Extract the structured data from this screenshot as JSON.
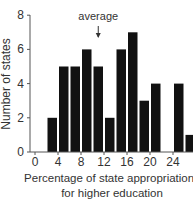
{
  "chart_data": {
    "type": "bar",
    "title": "",
    "xlabel": "Percentage of state appropriations for higher education",
    "xlabel_lines": [
      "Percentage of state appropriations",
      "for higher education"
    ],
    "ylabel": "Number of states",
    "bins": [
      [
        2,
        4
      ],
      [
        4,
        6
      ],
      [
        6,
        8
      ],
      [
        8,
        10
      ],
      [
        10,
        12
      ],
      [
        12,
        14
      ],
      [
        14,
        16
      ],
      [
        16,
        18
      ],
      [
        18,
        20
      ],
      [
        20,
        22
      ],
      [
        22,
        24
      ],
      [
        24,
        26
      ],
      [
        26,
        28
      ]
    ],
    "categories": [
      "2-4",
      "4-6",
      "6-8",
      "8-10",
      "10-12",
      "12-14",
      "14-16",
      "16-18",
      "18-20",
      "20-22",
      "22-24",
      "24-26",
      "26-28"
    ],
    "values": [
      2,
      5,
      5,
      6,
      5,
      2,
      6,
      7,
      3,
      4,
      0,
      4,
      1
    ],
    "xticks": [
      0,
      4,
      8,
      12,
      16,
      20,
      24
    ],
    "yticks": [
      0,
      2,
      4,
      6,
      8
    ],
    "xlim": [
      0,
      28
    ],
    "ylim": [
      0,
      8
    ],
    "grid": false,
    "bar_color": "#111111",
    "annotations": [
      {
        "text": "average",
        "x": 11,
        "arrow": "down"
      }
    ]
  }
}
